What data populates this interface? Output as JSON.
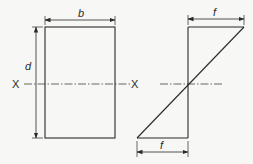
{
  "diagram": {
    "colors": {
      "stroke": "#2a2a2a",
      "background": "#f7f7f5"
    },
    "section": {
      "width_label": "b",
      "depth_label": "d",
      "axis_left_label": "X",
      "axis_right_label": "X"
    },
    "stress": {
      "top_label": "f",
      "bottom_label": "f"
    }
  }
}
